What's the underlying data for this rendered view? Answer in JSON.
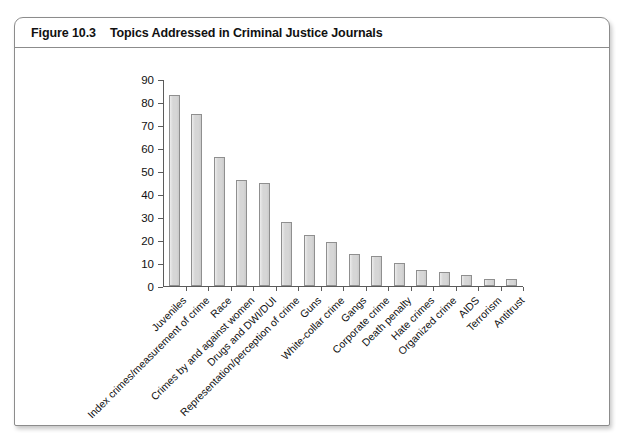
{
  "figure": {
    "number": "Figure 10.3",
    "title": "Topics Addressed in Criminal Justice Journals"
  },
  "chart_data": {
    "type": "bar",
    "title": "Topics Addressed in Criminal Justice Journals",
    "xlabel": "",
    "ylabel": "",
    "ylim": [
      0,
      90
    ],
    "yticks": [
      0,
      10,
      20,
      30,
      40,
      50,
      60,
      70,
      80,
      90
    ],
    "grid": false,
    "legend": "none",
    "categories": [
      "Juveniles",
      "Index crimes/measurement of crime",
      "Race",
      "Crimes by and against women",
      "Drugs and DWI/DUI",
      "Representation/perception of crime",
      "Guns",
      "White-collar crime",
      "Gangs",
      "Corporate crime",
      "Death penalty",
      "Hate crimes",
      "Organized crime",
      "AIDS",
      "Terrorism",
      "Antitrust"
    ],
    "values": [
      83,
      75,
      56,
      46,
      45,
      28,
      22,
      19,
      14,
      13,
      10,
      7,
      6,
      5,
      3,
      3
    ],
    "bar_color": "#d6d6d6",
    "bar_border_color": "#8f8f8f",
    "axis_color": "#5b5b5b"
  }
}
